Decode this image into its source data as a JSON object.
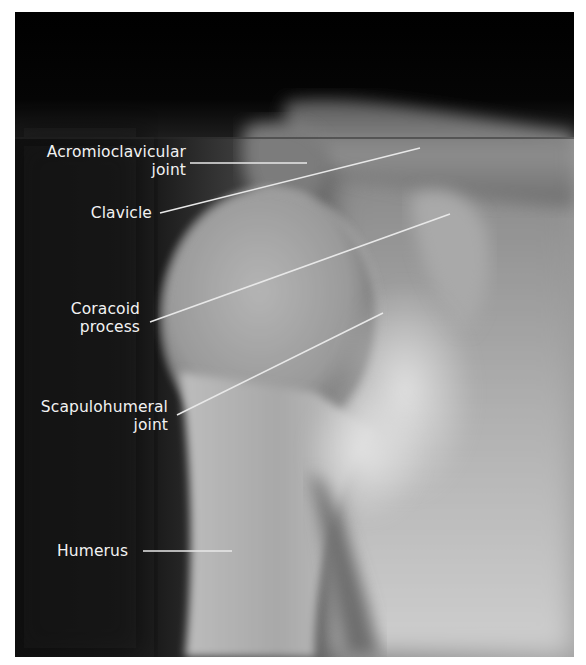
{
  "figure": {
    "background_color": "#ffffff",
    "label_color": "#f2f2f2",
    "leader_line_color": "#e8e8e8"
  },
  "labels": [
    {
      "id": "acromioclavicular",
      "line1": "Acromioclavicular",
      "line2": "joint"
    },
    {
      "id": "clavicle",
      "line1": "Clavicle"
    },
    {
      "id": "coracoid",
      "line1": "Coracoid",
      "line2": "process"
    },
    {
      "id": "scapulohumeral",
      "line1": "Scapulohumeral",
      "line2": "joint"
    },
    {
      "id": "humerus",
      "line1": "Humerus"
    }
  ]
}
